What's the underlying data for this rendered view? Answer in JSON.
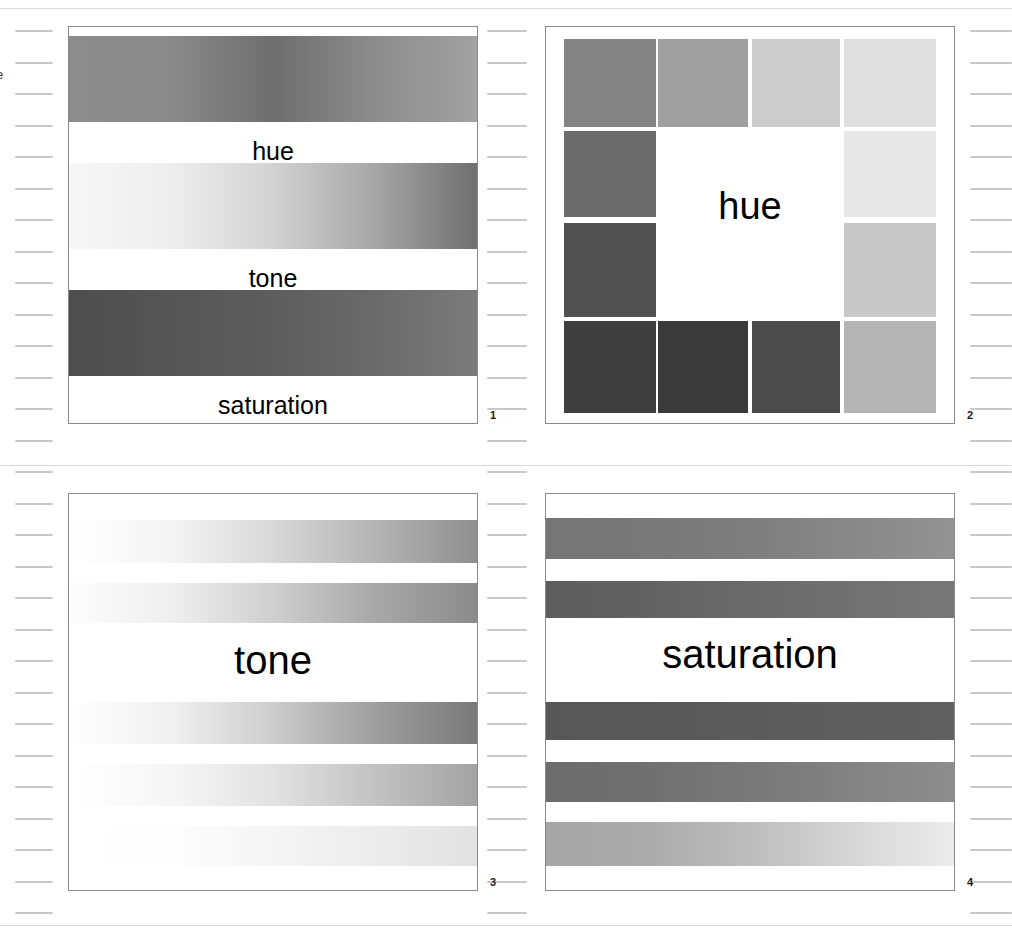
{
  "page": {
    "background": "#ffffff",
    "width": 1012,
    "height": 936,
    "margin_glyph": "e",
    "rules": [
      {
        "name": "top-rule",
        "y": 8
      },
      {
        "name": "middle-rule",
        "y": 465
      },
      {
        "name": "bottom-rule",
        "y": 925
      }
    ]
  },
  "rulers": {
    "tick_color": "#c9c9c9",
    "tick_start_y": 30,
    "tick_spacing": 31.5,
    "tick_count": 29,
    "columns": [
      {
        "name": "left-ruler",
        "x": 15,
        "width": 38
      },
      {
        "name": "middle-ruler",
        "x": 487,
        "width": 40
      },
      {
        "name": "right-ruler",
        "x": 970,
        "width": 42
      }
    ]
  },
  "panels": [
    {
      "id": 1,
      "name": "panel-hue-tone-saturation",
      "number_label": "1",
      "x": 68,
      "y": 26,
      "width": 410,
      "height": 398,
      "border_color": "#8a8a8a",
      "type": "labelled-gradient-bands",
      "bands": [
        {
          "name": "hue-band",
          "label": "hue",
          "label_size": 25,
          "top": 9,
          "height": 86,
          "gradient_type": "linear-horizontal",
          "stops": [
            "#8d8d8d",
            "#8a8a8a",
            "#6e6e6e",
            "#8c8c8c",
            "#a2a2a2"
          ]
        },
        {
          "name": "tone-band",
          "label": "tone",
          "label_size": 25,
          "top": 136,
          "height": 86,
          "gradient_type": "linear-horizontal",
          "stops": [
            "#f7f7f7",
            "#eeeeee",
            "#d2d2d2",
            "#a6a6a6",
            "#6f6f6f"
          ]
        },
        {
          "name": "saturation-band",
          "label": "saturation",
          "label_size": 25,
          "top": 263,
          "height": 86,
          "gradient_type": "linear-horizontal",
          "stops": [
            "#4e4e4e",
            "#555555",
            "#5d5d5d",
            "#6a6a6a",
            "#7b7b7b"
          ]
        }
      ]
    },
    {
      "id": 2,
      "name": "panel-hue-swatch-ring",
      "number_label": "2",
      "x": 545,
      "y": 26,
      "width": 410,
      "height": 398,
      "border_color": "#8a8a8a",
      "type": "swatch-ring",
      "center_label": "hue",
      "center_label_size": 38,
      "center_label_top": 160,
      "swatches": [
        {
          "name": "swatch-top-1",
          "x": 18,
          "y": 12,
          "w": 92,
          "h": 88,
          "color": "#838383"
        },
        {
          "name": "swatch-top-2",
          "x": 112,
          "y": 12,
          "w": 90,
          "h": 88,
          "color": "#9f9f9f"
        },
        {
          "name": "swatch-top-3",
          "x": 206,
          "y": 12,
          "w": 88,
          "h": 88,
          "color": "#cccccc"
        },
        {
          "name": "swatch-top-4",
          "x": 298,
          "y": 12,
          "w": 92,
          "h": 88,
          "color": "#e0e0e0"
        },
        {
          "name": "swatch-left-1",
          "x": 18,
          "y": 104,
          "w": 92,
          "h": 86,
          "color": "#6b6b6b"
        },
        {
          "name": "swatch-left-2",
          "x": 18,
          "y": 196,
          "w": 92,
          "h": 94,
          "color": "#515151"
        },
        {
          "name": "swatch-right-1",
          "x": 298,
          "y": 104,
          "w": 92,
          "h": 86,
          "color": "#e8e8e8"
        },
        {
          "name": "swatch-right-2",
          "x": 298,
          "y": 196,
          "w": 92,
          "h": 94,
          "color": "#c8c8c8"
        },
        {
          "name": "swatch-bottom-1",
          "x": 18,
          "y": 294,
          "w": 92,
          "h": 92,
          "color": "#3f3f3f"
        },
        {
          "name": "swatch-bottom-2",
          "x": 112,
          "y": 294,
          "w": 90,
          "h": 92,
          "color": "#3a3a3a"
        },
        {
          "name": "swatch-bottom-3",
          "x": 206,
          "y": 294,
          "w": 88,
          "h": 92,
          "color": "#4b4b4b"
        },
        {
          "name": "swatch-bottom-4",
          "x": 298,
          "y": 294,
          "w": 92,
          "h": 92,
          "color": "#b4b4b4"
        }
      ]
    },
    {
      "id": 3,
      "name": "panel-tone-bands",
      "number_label": "3",
      "x": 68,
      "y": 493,
      "width": 410,
      "height": 398,
      "border_color": "#8a8a8a",
      "type": "gradient-bands",
      "center_label": "tone",
      "center_label_size": 40,
      "center_label_top": 146,
      "bands": [
        {
          "name": "tone-band-1",
          "top": 26,
          "height": 43,
          "gradient_type": "linear-horizontal",
          "stops": [
            "#ffffff",
            "#f4f4f4",
            "#d8d8d8",
            "#b4b4b4",
            "#8f8f8f"
          ]
        },
        {
          "name": "tone-band-2",
          "top": 89,
          "height": 40,
          "gradient_type": "linear-horizontal",
          "stops": [
            "#fdfdfd",
            "#efefef",
            "#cfcfcf",
            "#a8a8a8",
            "#8b8b8b"
          ]
        },
        {
          "name": "tone-band-3",
          "top": 208,
          "height": 42,
          "gradient_type": "linear-horizontal",
          "stops": [
            "#ffffff",
            "#f0f0f0",
            "#cdcdcd",
            "#9e9e9e",
            "#797979"
          ]
        },
        {
          "name": "tone-band-4",
          "top": 270,
          "height": 42,
          "gradient_type": "linear-horizontal",
          "stops": [
            "#ffffff",
            "#f6f6f6",
            "#e2e2e2",
            "#c2c2c2",
            "#a3a3a3"
          ]
        },
        {
          "name": "tone-band-5",
          "top": 332,
          "height": 40,
          "gradient_type": "linear-horizontal",
          "stops": [
            "#ffffff",
            "#fdfdfd",
            "#f5f5f5",
            "#ececec",
            "#e2e2e2"
          ]
        }
      ]
    },
    {
      "id": 4,
      "name": "panel-saturation-bands",
      "number_label": "4",
      "x": 545,
      "y": 493,
      "width": 410,
      "height": 398,
      "border_color": "#8a8a8a",
      "type": "gradient-bands",
      "center_label": "saturation",
      "center_label_size": 40,
      "center_label_top": 140,
      "bands": [
        {
          "name": "saturation-band-1",
          "top": 24,
          "height": 41,
          "gradient_type": "linear-horizontal",
          "stops": [
            "#757575",
            "#787878",
            "#7e7e7e",
            "#888888",
            "#939393"
          ]
        },
        {
          "name": "saturation-band-2",
          "top": 87,
          "height": 37,
          "gradient_type": "linear-horizontal",
          "stops": [
            "#5d5d5d",
            "#626262",
            "#6a6a6a",
            "#717171",
            "#777777"
          ]
        },
        {
          "name": "saturation-band-3",
          "top": 208,
          "height": 38,
          "gradient_type": "linear-horizontal",
          "stops": [
            "#575757",
            "#585858",
            "#5b5b5b",
            "#5e5e5e",
            "#606060"
          ]
        },
        {
          "name": "saturation-band-4",
          "top": 268,
          "height": 40,
          "gradient_type": "linear-horizontal",
          "stops": [
            "#6c6c6c",
            "#707070",
            "#787878",
            "#838383",
            "#8d8d8d"
          ]
        },
        {
          "name": "saturation-band-5",
          "top": 328,
          "height": 44,
          "gradient_type": "linear-horizontal",
          "stops": [
            "#a6a6a6",
            "#ababab",
            "#bdbdbd",
            "#d6d6d6",
            "#ececec"
          ]
        }
      ]
    }
  ]
}
